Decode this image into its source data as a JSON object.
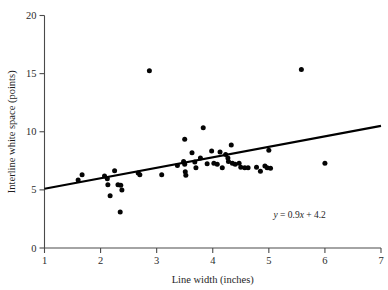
{
  "chart_data": {
    "type": "scatter",
    "title": "",
    "xlabel": "Line width (inches)",
    "ylabel": "Interline white space (points)",
    "xlim": [
      1,
      7
    ],
    "ylim": [
      0,
      20
    ],
    "xticks": [
      1,
      2,
      3,
      4,
      5,
      6,
      7
    ],
    "yticks": [
      0,
      5,
      10,
      15,
      20
    ],
    "xticklabels": [
      "1",
      "2",
      "3",
      "4",
      "5",
      "6",
      "7"
    ],
    "yticklabels": [
      "0",
      "5",
      "10",
      "15",
      "20"
    ],
    "grid": false,
    "legend": null,
    "annotations": [
      {
        "name": "regression-equation",
        "text": "y = 0.9x + 4.2",
        "text_parts": {
          "lhs": "y",
          "body": " = 0.9",
          "xvar": "x",
          "tail": " + 4.2"
        },
        "x": 5.55,
        "y": 2.55
      }
    ],
    "series": [
      {
        "name": "observations",
        "type": "scatter",
        "marker": "filled-circle",
        "color": "#050505",
        "points": [
          [
            1.6,
            5.85
          ],
          [
            1.67,
            6.3
          ],
          [
            2.07,
            6.2
          ],
          [
            2.12,
            5.95
          ],
          [
            2.13,
            5.45
          ],
          [
            2.17,
            4.5
          ],
          [
            2.25,
            6.65
          ],
          [
            2.31,
            5.45
          ],
          [
            2.36,
            5.4
          ],
          [
            2.38,
            5.0
          ],
          [
            2.35,
            3.1
          ],
          [
            2.67,
            6.45
          ],
          [
            2.7,
            6.3
          ],
          [
            2.87,
            15.25
          ],
          [
            3.09,
            6.3
          ],
          [
            3.37,
            7.1
          ],
          [
            3.48,
            7.45
          ],
          [
            3.5,
            7.2
          ],
          [
            3.5,
            9.35
          ],
          [
            3.51,
            6.55
          ],
          [
            3.52,
            6.25
          ],
          [
            3.63,
            8.2
          ],
          [
            3.68,
            7.4
          ],
          [
            3.7,
            6.9
          ],
          [
            3.78,
            7.75
          ],
          [
            3.83,
            10.35
          ],
          [
            3.9,
            7.25
          ],
          [
            3.98,
            8.35
          ],
          [
            4.02,
            7.3
          ],
          [
            4.08,
            7.2
          ],
          [
            4.13,
            8.25
          ],
          [
            4.17,
            6.9
          ],
          [
            4.23,
            8.05
          ],
          [
            4.27,
            7.75
          ],
          [
            4.28,
            7.45
          ],
          [
            4.33,
            8.85
          ],
          [
            4.35,
            7.3
          ],
          [
            4.4,
            7.2
          ],
          [
            4.47,
            7.3
          ],
          [
            4.5,
            6.95
          ],
          [
            4.57,
            6.9
          ],
          [
            4.63,
            6.9
          ],
          [
            4.78,
            6.95
          ],
          [
            4.85,
            6.6
          ],
          [
            4.93,
            7.05
          ],
          [
            4.97,
            6.9
          ],
          [
            5.0,
            8.4
          ],
          [
            5.03,
            6.85
          ],
          [
            5.58,
            15.35
          ],
          [
            6.0,
            7.3
          ]
        ]
      },
      {
        "name": "regression-line",
        "type": "line",
        "color": "#000000",
        "slope": 0.9,
        "intercept": 4.2,
        "x": [
          1,
          7
        ],
        "y": [
          5.1,
          10.5
        ]
      }
    ]
  },
  "axes": {
    "x_title": "Line width (inches)",
    "y_title": "Interline white space (points)"
  }
}
